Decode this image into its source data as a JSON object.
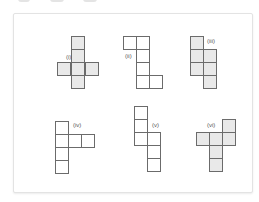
{
  "figure": {
    "background": "#ffffff",
    "frame_border": "#e3e3e3",
    "square_size": 13,
    "stroke_color": "#6b6b6b",
    "shaded_fill": "#e9e9e9",
    "unshaded_fill": "#ffffff",
    "nets": [
      {
        "label": "(i)",
        "label_pos": [
          66,
          59
        ],
        "shaded": true,
        "cells": [
          [
            71,
            36
          ],
          [
            71,
            49
          ],
          [
            57,
            62
          ],
          [
            71,
            62
          ],
          [
            85,
            62
          ],
          [
            71,
            75
          ]
        ]
      },
      {
        "label": "(ii)",
        "label_pos": [
          125,
          58
        ],
        "shaded": false,
        "cells": [
          [
            123,
            36
          ],
          [
            136,
            36
          ],
          [
            136,
            49
          ],
          [
            136,
            62
          ],
          [
            136,
            75
          ],
          [
            149,
            75
          ]
        ]
      },
      {
        "label": "(iii)",
        "label_pos": [
          207,
          43
        ],
        "shaded": true,
        "cells": [
          [
            190,
            36
          ],
          [
            190,
            49
          ],
          [
            203,
            49
          ],
          [
            190,
            62
          ],
          [
            203,
            62
          ],
          [
            203,
            75
          ]
        ]
      },
      {
        "label": "(iv)",
        "label_pos": [
          73,
          127
        ],
        "shaded": false,
        "cells": [
          [
            55,
            121
          ],
          [
            55,
            134
          ],
          [
            68,
            134
          ],
          [
            81,
            134
          ],
          [
            55,
            147
          ],
          [
            55,
            160
          ]
        ]
      },
      {
        "label": "(v)",
        "label_pos": [
          152,
          127
        ],
        "shaded": false,
        "cells": [
          [
            134,
            106
          ],
          [
            134,
            119
          ],
          [
            134,
            132
          ],
          [
            147,
            132
          ],
          [
            147,
            145
          ],
          [
            147,
            158
          ]
        ]
      },
      {
        "label": "(vi)",
        "label_pos": [
          207,
          127
        ],
        "shaded": true,
        "cells": [
          [
            222,
            119
          ],
          [
            196,
            132
          ],
          [
            209,
            132
          ],
          [
            222,
            132
          ],
          [
            209,
            145
          ],
          [
            209,
            158
          ]
        ]
      }
    ]
  }
}
